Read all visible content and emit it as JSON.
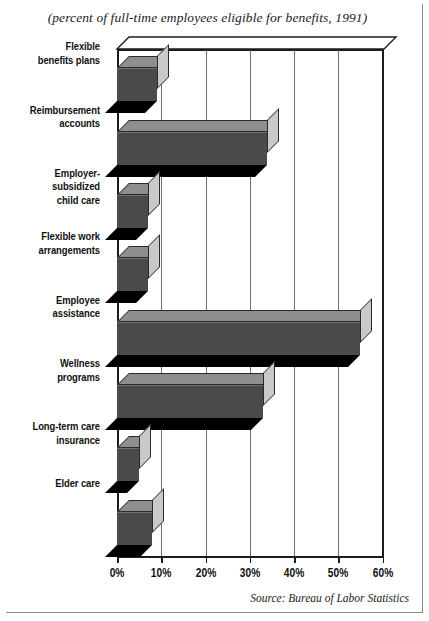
{
  "subtitle": "(percent of full-time employees eligible for benefits, 1991)",
  "source": "Source: Bureau of Labor Statistics",
  "chart_data": {
    "type": "bar",
    "orientation": "horizontal",
    "title": "",
    "subtitle": "(percent of full-time employees eligible for benefits, 1991)",
    "xlabel": "",
    "ylabel": "",
    "xlim": [
      0,
      60
    ],
    "xtick_labels": [
      "0%",
      "10%",
      "20%",
      "30%",
      "40%",
      "50%",
      "60%"
    ],
    "xticks": [
      0,
      10,
      20,
      30,
      40,
      50,
      60
    ],
    "grid": true,
    "legend": null,
    "style": "3d-bar",
    "bar_color": "#4a4a4a",
    "categories": [
      "Flexible\nbenefits plans",
      "Reimbursement\naccounts",
      "Employer-subsidized\nchild care",
      "Flexible work\narrangements",
      "Employee\nassistance",
      "Wellness\nprograms",
      "Long-term care\ninsurance",
      "Elder  care"
    ],
    "values": [
      9,
      34,
      7,
      7,
      55,
      33,
      5,
      8
    ],
    "source": "Source: Bureau of Labor Statistics"
  },
  "categories": [
    {
      "line1": "Flexible",
      "line2": "benefits plans",
      "value": 9
    },
    {
      "line1": "Reimbursement",
      "line2": "accounts",
      "value": 34
    },
    {
      "line1": "Employer-subsidized",
      "line2": "child care",
      "value": 7
    },
    {
      "line1": "Flexible work",
      "line2": "arrangements",
      "value": 7
    },
    {
      "line1": "Employee",
      "line2": "assistance",
      "value": 55
    },
    {
      "line1": "Wellness",
      "line2": "programs",
      "value": 33
    },
    {
      "line1": "Long-term care",
      "line2": "insurance",
      "value": 5
    },
    {
      "line1": "Elder  care",
      "line2": "",
      "value": 8
    }
  ]
}
